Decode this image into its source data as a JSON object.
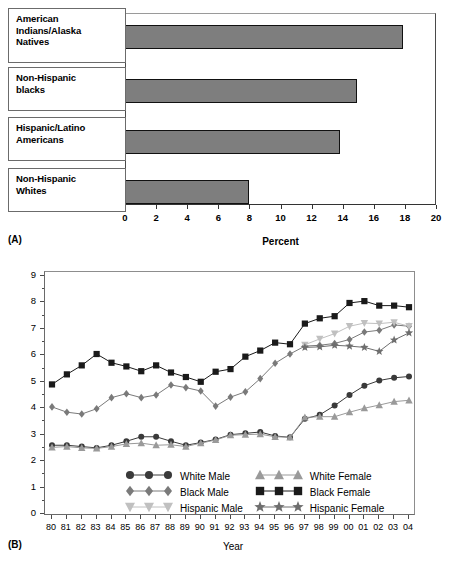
{
  "figure": {
    "panelA_letter": "(A)",
    "panelB_letter": "(B)"
  },
  "chart_data": [
    {
      "type": "bar",
      "panel": "A",
      "orientation": "horizontal",
      "title": "",
      "xlabel": "Percent",
      "ylabel": "",
      "xlim": [
        0,
        20
      ],
      "xticks": [
        "0",
        "2",
        "4",
        "6",
        "8",
        "10",
        "12",
        "14",
        "16",
        "18",
        "20"
      ],
      "grid": false,
      "bar_color": "#7e7e7e",
      "categories": [
        "American Indians/Alaska Natives",
        "Non-Hispanic blacks",
        "Hispanic/Latino Americans",
        "Non-Hispanic Whites"
      ],
      "category_lines": [
        [
          "American",
          "Indians/Alaska",
          "Natives"
        ],
        [
          "Non-Hispanic",
          "blacks"
        ],
        [
          "Hispanic/Latino",
          "Americans"
        ],
        [
          "Non-Hispanic",
          "Whites"
        ]
      ],
      "values": [
        17.9,
        14.9,
        13.8,
        8.0
      ]
    },
    {
      "type": "line",
      "panel": "B",
      "title": "",
      "xlabel": "Year",
      "ylabel": "Rate (per 100)",
      "ylim": [
        0,
        9
      ],
      "yticks": [
        "0",
        "1",
        "2",
        "3",
        "4",
        "5",
        "6",
        "7",
        "8",
        "9"
      ],
      "grid": false,
      "legend_position": "inside-bottom-center",
      "x": [
        "80",
        "81",
        "82",
        "83",
        "84",
        "85",
        "86",
        "87",
        "88",
        "89",
        "90",
        "91",
        "92",
        "93",
        "94",
        "95",
        "96",
        "97",
        "98",
        "99",
        "00",
        "01",
        "02",
        "03",
        "04"
      ],
      "series": [
        {
          "name": "White Male",
          "marker": "circle",
          "color": "#3a3a3a",
          "values": [
            2.6,
            2.6,
            2.55,
            2.5,
            2.6,
            2.75,
            2.92,
            2.92,
            2.75,
            2.6,
            2.7,
            2.82,
            3.0,
            3.05,
            3.1,
            2.95,
            2.9,
            3.6,
            3.75,
            4.1,
            4.5,
            4.85,
            5.05,
            5.15,
            5.2
          ]
        },
        {
          "name": "Black Male",
          "marker": "diamond",
          "color": "#7a7a7a",
          "values": [
            4.05,
            3.85,
            3.78,
            3.98,
            4.4,
            4.55,
            4.4,
            4.5,
            4.88,
            4.78,
            4.65,
            4.08,
            4.42,
            4.62,
            5.12,
            5.7,
            6.05,
            6.35,
            6.38,
            6.45,
            6.6,
            6.88,
            6.95,
            7.15,
            7.1
          ]
        },
        {
          "name": "Hispanic Male",
          "marker": "triangle-down",
          "color": "#c0c0c0",
          "values": [
            null,
            null,
            null,
            null,
            null,
            null,
            null,
            null,
            null,
            null,
            null,
            null,
            null,
            null,
            null,
            null,
            null,
            6.4,
            6.62,
            6.82,
            7.1,
            7.22,
            7.2,
            7.25,
            7.1
          ]
        },
        {
          "name": "White Female",
          "marker": "triangle-up",
          "color": "#9a9a9a",
          "values": [
            2.52,
            2.55,
            2.5,
            2.48,
            2.55,
            2.65,
            2.68,
            2.6,
            2.62,
            2.55,
            2.68,
            2.8,
            2.98,
            3.0,
            3.02,
            2.92,
            2.9,
            3.65,
            3.68,
            3.68,
            3.85,
            4.0,
            4.12,
            4.25,
            4.3
          ]
        },
        {
          "name": "Black Female",
          "marker": "square",
          "color": "#1a1a1a",
          "values": [
            4.9,
            5.28,
            5.62,
            6.05,
            5.72,
            5.58,
            5.4,
            5.62,
            5.35,
            5.18,
            5.0,
            5.38,
            5.48,
            5.95,
            6.18,
            6.48,
            6.42,
            7.2,
            7.4,
            7.48,
            7.98,
            8.05,
            7.88,
            7.88,
            7.82
          ]
        },
        {
          "name": "Hispanic Female",
          "marker": "star",
          "color": "#6e6e6e",
          "values": [
            null,
            null,
            null,
            null,
            null,
            null,
            null,
            null,
            null,
            null,
            null,
            null,
            null,
            null,
            null,
            null,
            null,
            6.3,
            6.32,
            6.38,
            6.35,
            6.3,
            6.15,
            6.58,
            6.85
          ]
        }
      ],
      "legend": [
        {
          "label": "White Male",
          "marker": "circle",
          "color": "#3a3a3a"
        },
        {
          "label": "Black Male",
          "marker": "diamond",
          "color": "#7a7a7a"
        },
        {
          "label": "Hispanic Male",
          "marker": "triangle-down",
          "color": "#c0c0c0"
        },
        {
          "label": "White Female",
          "marker": "triangle-up",
          "color": "#9a9a9a"
        },
        {
          "label": "Black Female",
          "marker": "square",
          "color": "#1a1a1a"
        },
        {
          "label": "Hispanic Female",
          "marker": "star",
          "color": "#6e6e6e"
        }
      ]
    }
  ]
}
